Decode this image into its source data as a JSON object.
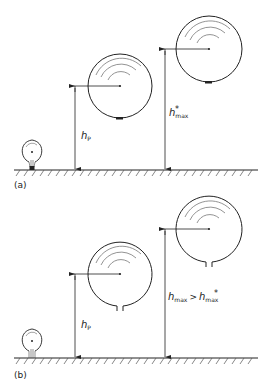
{
  "panels": [
    {
      "id": "a",
      "label": "(a)",
      "height_label_1": {
        "base": "h",
        "sub": "P",
        "sup": ""
      },
      "height_label_2": {
        "base": "h",
        "sub": "max",
        "sup": "*"
      },
      "balloon_neck": "closed"
    },
    {
      "id": "b",
      "label": "(b)",
      "height_label_1": {
        "base": "h",
        "sub": "P",
        "sup": ""
      },
      "height_label_2": {
        "base": "h",
        "sub": "max",
        "sup": "",
        "relation": ">",
        "rhs_base": "h",
        "rhs_sub": "max",
        "rhs_sup": "*"
      },
      "balloon_neck": "open"
    }
  ],
  "colors": {
    "line": "#222222",
    "background": "#ffffff"
  }
}
